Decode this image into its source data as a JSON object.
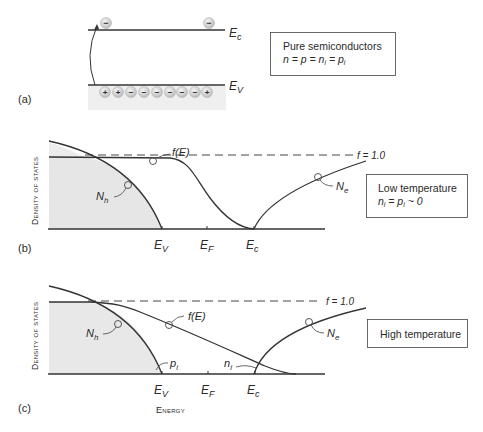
{
  "panel_a": {
    "label": "(a)",
    "ec_label": "E",
    "ec_sub": "c",
    "ev_label": "E",
    "ev_sub": "V",
    "conduction_electrons": [
      "−",
      "−"
    ],
    "valence_carriers": [
      "+",
      "+",
      "−",
      "−",
      "−",
      "−",
      "−",
      "−",
      "+"
    ],
    "box": {
      "title": "Pure semiconductors",
      "equation": "n = p = n",
      "eq_parts": [
        "n = p = n",
        "i",
        " = p",
        "i"
      ]
    }
  },
  "panel_b": {
    "label": "(b)",
    "y_axis_label": "Density of states",
    "f_label": "f(E)",
    "f_one_label": "f = 1.0",
    "nh_label": "N",
    "nh_sub": "h",
    "ne_label": "N",
    "ne_sub": "e",
    "x_ticks": [
      {
        "main": "E",
        "sub": "V"
      },
      {
        "main": "E",
        "sub": "F"
      },
      {
        "main": "E",
        "sub": "c"
      }
    ],
    "box": {
      "title": "Low temperature",
      "eq_parts": [
        "n",
        "i",
        " = p",
        "i",
        " ~ 0"
      ]
    }
  },
  "panel_c": {
    "label": "(c)",
    "y_axis_label": "Density of states",
    "x_axis_label": "Energy",
    "f_label": "f(E)",
    "f_one_label": "f = 1.0",
    "nh_label": "N",
    "nh_sub": "h",
    "ne_label": "N",
    "ne_sub": "e",
    "pi_label": "p",
    "pi_sub": "i",
    "ni_label": "n",
    "ni_sub": "i",
    "x_ticks": [
      {
        "main": "E",
        "sub": "V"
      },
      {
        "main": "E",
        "sub": "F"
      },
      {
        "main": "E",
        "sub": "c"
      }
    ],
    "box": {
      "title": "High temperature"
    }
  },
  "colors": {
    "line": "#333333",
    "shade": "#ececec",
    "carrier_fill": "#d8d8d8",
    "band_shade": "#f0f0f0"
  }
}
